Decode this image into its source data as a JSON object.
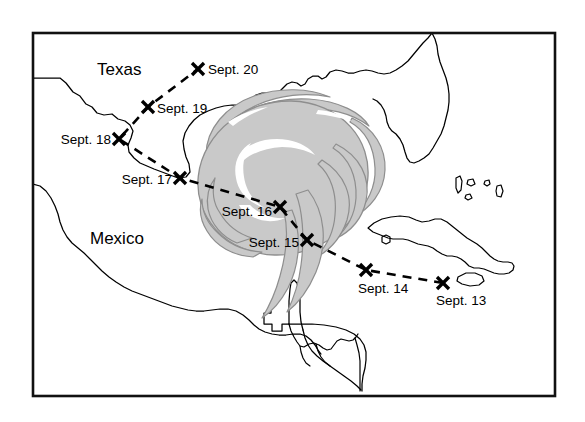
{
  "figure": {
    "kind": "hurricane-track-map",
    "frame": {
      "x": 33,
      "y": 33,
      "width": 522,
      "height": 363
    },
    "background_color": "#ffffff",
    "line_color": "#000000"
  },
  "region_labels": [
    {
      "id": "texas",
      "text": "Texas",
      "x": 97,
      "y": 75
    },
    {
      "id": "mexico",
      "text": "Mexico",
      "x": 90,
      "y": 244
    }
  ],
  "storm": {
    "name": "hurricane-symbol",
    "fill_color": "#c9c9c9",
    "outline_color": "#8e8e8e",
    "eye_color": "#ffffff",
    "center": {
      "x": 283,
      "y": 178
    }
  },
  "track": {
    "style": "dashed",
    "color": "#000000",
    "points": [
      {
        "id": "sept-20",
        "label": "Sept. 20",
        "x": 198,
        "y": 69,
        "label_x": 208,
        "label_y": 74,
        "label_anchor": "start"
      },
      {
        "id": "sept-19",
        "label": "Sept. 19",
        "x": 148,
        "y": 107,
        "label_x": 157,
        "label_y": 113,
        "label_anchor": "start"
      },
      {
        "id": "sept-18",
        "label": "Sept. 18",
        "x": 119,
        "y": 139,
        "label_x": 111,
        "label_y": 144,
        "label_anchor": "end"
      },
      {
        "id": "sept-17",
        "label": "Sept. 17",
        "x": 180,
        "y": 178,
        "label_x": 172,
        "label_y": 184,
        "label_anchor": "end"
      },
      {
        "id": "sept-16",
        "label": "Sept. 16",
        "x": 280,
        "y": 207,
        "label_x": 272,
        "label_y": 216,
        "label_anchor": "end"
      },
      {
        "id": "sept-15",
        "label": "Sept. 15",
        "x": 307,
        "y": 240,
        "label_x": 299,
        "label_y": 247,
        "label_anchor": "end"
      },
      {
        "id": "sept-14",
        "label": "Sept. 14",
        "x": 366,
        "y": 270,
        "label_x": 358,
        "label_y": 293,
        "label_anchor": "start"
      },
      {
        "id": "sept-13",
        "label": "Sept. 13",
        "x": 443,
        "y": 283,
        "label_x": 436,
        "label_y": 305,
        "label_anchor": "start"
      }
    ]
  },
  "geography": {
    "landmasses": [
      "united-states-gulf-coast",
      "florida-peninsula",
      "mexico",
      "yucatan-peninsula",
      "central-america",
      "cuba",
      "bahamas",
      "cayman-island"
    ]
  }
}
